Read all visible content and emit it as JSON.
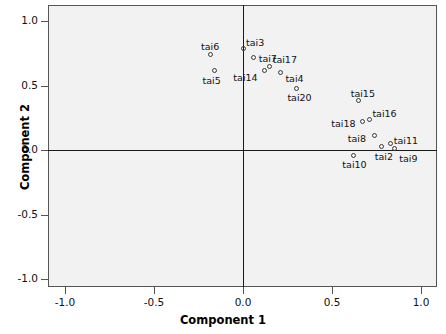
{
  "chart_data": {
    "type": "scatter",
    "title": "",
    "xlabel": "Component 1",
    "ylabel": "Component 2",
    "xlim": [
      -1.25,
      1.1
    ],
    "ylim": [
      -1.12,
      1.09
    ],
    "grid": false,
    "legend": "none",
    "reference_lines": {
      "x": 0.0,
      "y": 0.0
    },
    "xticks": [
      "-1.0",
      "-0.5",
      "0.0",
      "0.5",
      "1.0"
    ],
    "xtick_values": [
      -1.0,
      -0.5,
      0.0,
      0.5,
      1.0
    ],
    "yticks": [
      "1.0",
      "0.5",
      "0.0",
      "-0.5",
      "-1.0"
    ],
    "ytick_values": [
      1.0,
      0.5,
      0.0,
      -0.5,
      -1.0
    ],
    "points": [
      {
        "label": "tai6",
        "x": -0.18,
        "y": 0.74,
        "label_dx": -10,
        "label_dy": -14
      },
      {
        "label": "tai3",
        "x": 0.0,
        "y": 0.79,
        "label_dx": 3,
        "label_dy": -11
      },
      {
        "label": "tai5",
        "x": -0.16,
        "y": 0.62,
        "label_dx": -12,
        "label_dy": 5
      },
      {
        "label": "tai7",
        "x": 0.06,
        "y": 0.72,
        "label_dx": 5,
        "label_dy": -4
      },
      {
        "label": "tai17",
        "x": 0.15,
        "y": 0.65,
        "label_dx": 3,
        "label_dy": -12
      },
      {
        "label": "tai14",
        "x": 0.12,
        "y": 0.62,
        "label_dx": -31,
        "label_dy": 2
      },
      {
        "label": "tai4",
        "x": 0.21,
        "y": 0.6,
        "label_dx": 5,
        "label_dy": 0
      },
      {
        "label": "tai20",
        "x": 0.3,
        "y": 0.48,
        "label_dx": -9,
        "label_dy": 4
      },
      {
        "label": "tai15",
        "x": 0.65,
        "y": 0.38,
        "label_dx": -8,
        "label_dy": -13
      },
      {
        "label": "tai16",
        "x": 0.71,
        "y": 0.24,
        "label_dx": 3,
        "label_dy": -11
      },
      {
        "label": "tai18",
        "x": 0.67,
        "y": 0.22,
        "label_dx": -31,
        "label_dy": -4
      },
      {
        "label": "tai8",
        "x": 0.74,
        "y": 0.11,
        "label_dx": -27,
        "label_dy": -3
      },
      {
        "label": "tai11",
        "x": 0.83,
        "y": 0.05,
        "label_dx": 3,
        "label_dy": -9
      },
      {
        "label": "tai2",
        "x": 0.78,
        "y": 0.03,
        "label_dx": -7,
        "label_dy": 5
      },
      {
        "label": "tai9",
        "x": 0.85,
        "y": 0.01,
        "label_dx": 5,
        "label_dy": 4
      },
      {
        "label": "tai10",
        "x": 0.62,
        "y": -0.04,
        "label_dx": -11,
        "label_dy": 4
      }
    ],
    "marker_style": "open-circle",
    "marker_color": "#3a3a3a",
    "plot_background": "#f2f2f2",
    "frame_color": "#555555",
    "reference_line_color": "#1a1a1a"
  }
}
